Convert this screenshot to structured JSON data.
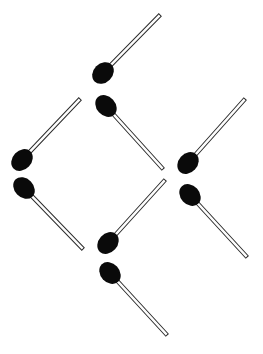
{
  "image": {
    "title": "Matchstick Arrangement",
    "width": 263,
    "height": 354,
    "background_color": "#ffffff",
    "description": "Eight matchsticks arranged as diagonal segments forming a lattice of diamond shapes on a plain white background."
  },
  "palette": {
    "match_head_color": "#0a0a0a",
    "match_stick_outline_color": "#2b2b2b",
    "match_stick_fill_color": "#fdfdfd",
    "background_color": "#ffffff"
  },
  "geometry": {
    "stick_width": 3.4,
    "head_radius_x": 9.5,
    "head_radius_y": 12.0,
    "outline_width": 1.0
  },
  "matchsticks": [
    {
      "id": "match-1",
      "label": "Match 1",
      "orientation": "up-right",
      "angle_deg": -45,
      "head": {
        "x": 103,
        "y": 73
      },
      "tip": {
        "x": 160,
        "y": 15
      }
    },
    {
      "id": "match-2",
      "label": "Match 2",
      "orientation": "up-right",
      "angle_deg": -46,
      "head": {
        "x": 22,
        "y": 160
      },
      "tip": {
        "x": 80,
        "y": 99
      }
    },
    {
      "id": "match-3",
      "label": "Match 3",
      "orientation": "down-right",
      "angle_deg": 48,
      "head": {
        "x": 106,
        "y": 106
      },
      "tip": {
        "x": 163,
        "y": 169
      }
    },
    {
      "id": "match-4",
      "label": "Match 4",
      "orientation": "up-right",
      "angle_deg": -48,
      "head": {
        "x": 188,
        "y": 163
      },
      "tip": {
        "x": 245,
        "y": 99
      }
    },
    {
      "id": "match-5",
      "label": "Match 5",
      "orientation": "down-right",
      "angle_deg": 46,
      "head": {
        "x": 24,
        "y": 188
      },
      "tip": {
        "x": 83,
        "y": 249
      }
    },
    {
      "id": "match-6",
      "label": "Match 6",
      "orientation": "up-right",
      "angle_deg": -48,
      "head": {
        "x": 108,
        "y": 243
      },
      "tip": {
        "x": 165,
        "y": 180
      }
    },
    {
      "id": "match-7",
      "label": "Match 7",
      "orientation": "down-right",
      "angle_deg": 47,
      "head": {
        "x": 190,
        "y": 195
      },
      "tip": {
        "x": 247,
        "y": 257
      }
    },
    {
      "id": "match-8",
      "label": "Match 8",
      "orientation": "down-right",
      "angle_deg": 47,
      "head": {
        "x": 110,
        "y": 273
      },
      "tip": {
        "x": 167,
        "y": 335
      }
    }
  ]
}
